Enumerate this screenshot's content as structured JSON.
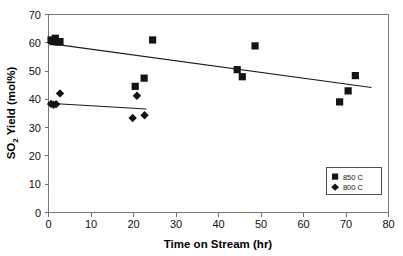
{
  "chart_data": {
    "type": "scatter",
    "title": "",
    "xlabel": "Time on Stream (hr)",
    "ylabel": "SO2 Yield (mol%)",
    "ylabel_main": "SO",
    "ylabel_sub": "2",
    "ylabel_rest": " Yield (mol%)",
    "xlim": [
      0,
      80
    ],
    "ylim": [
      0,
      70
    ],
    "xticks": [
      0,
      10,
      20,
      30,
      40,
      50,
      60,
      70,
      80
    ],
    "yticks": [
      0,
      10,
      20,
      30,
      40,
      50,
      60,
      70
    ],
    "grid": false,
    "legend_position": "lower-right",
    "series": [
      {
        "name": "850 C",
        "marker": "square",
        "color": "#141414",
        "points": [
          {
            "x": 0.6,
            "y": 61.0
          },
          {
            "x": 1.1,
            "y": 60.4
          },
          {
            "x": 1.6,
            "y": 61.6
          },
          {
            "x": 2.1,
            "y": 60.3
          },
          {
            "x": 2.7,
            "y": 60.4
          },
          {
            "x": 20.4,
            "y": 44.6
          },
          {
            "x": 22.5,
            "y": 47.5
          },
          {
            "x": 24.5,
            "y": 61.0
          },
          {
            "x": 44.4,
            "y": 50.5
          },
          {
            "x": 45.6,
            "y": 48.0
          },
          {
            "x": 48.6,
            "y": 58.9
          },
          {
            "x": 68.5,
            "y": 39.1
          },
          {
            "x": 70.5,
            "y": 43.0
          },
          {
            "x": 72.2,
            "y": 48.4
          }
        ],
        "trend": {
          "x1": 0.0,
          "y1": 59.8,
          "x2": 76.0,
          "y2": 44.2
        }
      },
      {
        "name": "800 C",
        "marker": "diamond",
        "color": "#141414",
        "points": [
          {
            "x": 0.6,
            "y": 38.4
          },
          {
            "x": 1.2,
            "y": 38.1
          },
          {
            "x": 1.8,
            "y": 38.3
          },
          {
            "x": 2.7,
            "y": 42.1
          },
          {
            "x": 19.8,
            "y": 33.4
          },
          {
            "x": 20.8,
            "y": 41.3
          },
          {
            "x": 22.6,
            "y": 34.4
          }
        ],
        "trend": {
          "x1": 0.0,
          "y1": 38.6,
          "x2": 23.0,
          "y2": 36.6
        }
      }
    ]
  },
  "legend": {
    "entries": [
      {
        "label": "850 C",
        "marker": "square"
      },
      {
        "label": "800 C",
        "marker": "diamond"
      }
    ]
  },
  "axes": {
    "x_title": "Time on Stream (hr)",
    "y_title_prefix": "SO",
    "y_title_subscript": "2",
    "y_title_suffix": " Yield (mol%)",
    "x_tick_labels": [
      "0",
      "10",
      "20",
      "30",
      "40",
      "50",
      "60",
      "70",
      "80"
    ],
    "y_tick_labels": [
      "0",
      "10",
      "20",
      "30",
      "40",
      "50",
      "60",
      "70"
    ]
  }
}
